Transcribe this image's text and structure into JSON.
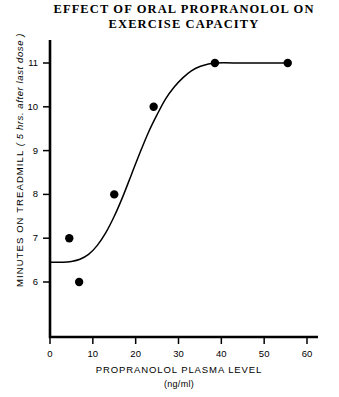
{
  "chart_data": {
    "type": "scatter",
    "title": "EFFECT OF ORAL PROPRANOLOL ON EXERCISE CAPACITY",
    "title_lines": [
      "EFFECT OF ORAL PROPRANOLOL ON",
      "EXERCISE CAPACITY"
    ],
    "xlabel": "PROPRANOLOL PLASMA LEVEL",
    "xlabel_units": "(ng/ml)",
    "ylabel": "MINUTES ON TREADMILL",
    "ylabel_note": "( 5 hrs. after last dose )",
    "xlim": [
      0,
      62
    ],
    "ylim": [
      5.4,
      11.6
    ],
    "xticks": [
      0,
      10,
      20,
      30,
      40,
      50,
      60
    ],
    "yticks": [
      6,
      7,
      8,
      9,
      10,
      11
    ],
    "grid": false,
    "legend": null,
    "points": [
      {
        "x": 4.5,
        "y": 7.0
      },
      {
        "x": 6.8,
        "y": 6.0
      },
      {
        "x": 15.0,
        "y": 8.0
      },
      {
        "x": 24.2,
        "y": 10.0
      },
      {
        "x": 38.5,
        "y": 11.0
      },
      {
        "x": 55.5,
        "y": 11.0
      }
    ],
    "fit_curve": {
      "name": "sigmoid fit",
      "x": [
        0,
        3,
        5,
        7,
        9,
        11,
        13,
        15,
        17,
        19,
        21,
        23,
        25,
        27,
        29,
        31,
        33,
        35,
        38.5,
        45,
        50,
        55.5
      ],
      "y": [
        6.45,
        6.45,
        6.47,
        6.52,
        6.63,
        6.83,
        7.12,
        7.5,
        7.95,
        8.45,
        8.95,
        9.42,
        9.82,
        10.18,
        10.45,
        10.66,
        10.82,
        10.92,
        11.0,
        11.0,
        11.0,
        11.0
      ]
    },
    "marker_color": "#000000",
    "line_color": "#000000",
    "axis_color": "#000000",
    "background": "#ffffff"
  }
}
